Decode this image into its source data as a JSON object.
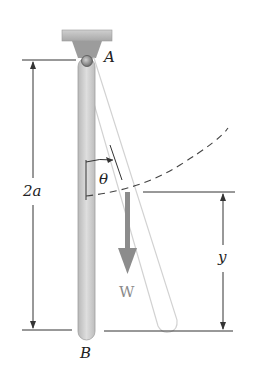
{
  "diagram": {
    "type": "pendulum-rod-statics",
    "labels": {
      "pivot": "A",
      "end": "B",
      "length": "2a",
      "angle": "θ",
      "height": "y",
      "weight": "W"
    },
    "colors": {
      "rod": "#c8c8c8",
      "rod_outline": "#9a9a9a",
      "support": "#b5b5b5",
      "ghost_rod": "#d5d5d5",
      "weight_arrow": "#8c8c8c",
      "dimension_lines": "#333333",
      "dashed_arc": "#444444"
    }
  }
}
